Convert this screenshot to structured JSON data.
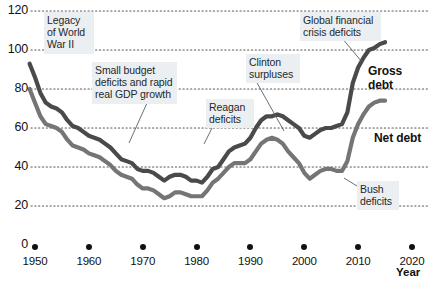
{
  "chart_data": {
    "type": "line",
    "title": "",
    "xlabel": "Year",
    "ylabel": "",
    "xlim": [
      1948,
      2022
    ],
    "ylim": [
      0,
      120
    ],
    "grid": "horizontal-dotted",
    "legend": "inline-direct-labels",
    "y_ticks": [
      0,
      20,
      40,
      60,
      80,
      100,
      120
    ],
    "x_ticks": [
      1950,
      1960,
      1970,
      1980,
      1990,
      2000,
      2010,
      2020
    ],
    "series": [
      {
        "name": "Gross debt",
        "color": "#4a4a4a",
        "x": [
          1949,
          1950,
          1951,
          1952,
          1953,
          1954,
          1955,
          1956,
          1957,
          1958,
          1959,
          1960,
          1961,
          1962,
          1963,
          1964,
          1965,
          1966,
          1967,
          1968,
          1969,
          1970,
          1971,
          1972,
          1973,
          1974,
          1975,
          1976,
          1977,
          1978,
          1979,
          1980,
          1981,
          1982,
          1983,
          1984,
          1985,
          1986,
          1987,
          1988,
          1989,
          1990,
          1991,
          1992,
          1993,
          1994,
          1995,
          1996,
          1997,
          1998,
          1999,
          2000,
          2001,
          2002,
          2003,
          2004,
          2005,
          2006,
          2007,
          2008,
          2009,
          2010,
          2011,
          2012,
          2013,
          2014,
          2015
        ],
        "values": [
          93,
          86,
          78,
          73,
          71,
          70,
          68,
          64,
          61,
          60,
          58,
          56,
          55,
          54,
          52,
          50,
          47,
          44,
          43,
          42,
          39,
          38,
          38,
          37,
          35,
          33,
          35,
          36,
          36,
          35,
          33,
          33,
          32,
          35,
          39,
          40,
          44,
          48,
          50,
          51,
          52,
          55,
          60,
          64,
          66,
          66,
          67,
          66,
          64,
          62,
          60,
          56,
          55,
          57,
          59,
          60,
          60,
          61,
          62,
          68,
          83,
          91,
          96,
          100,
          101,
          103,
          104
        ]
      },
      {
        "name": "Net debt",
        "color": "#757575",
        "x": [
          1949,
          1950,
          1951,
          1952,
          1953,
          1954,
          1955,
          1956,
          1957,
          1958,
          1959,
          1960,
          1961,
          1962,
          1963,
          1964,
          1965,
          1966,
          1967,
          1968,
          1969,
          1970,
          1971,
          1972,
          1973,
          1974,
          1975,
          1976,
          1977,
          1978,
          1979,
          1980,
          1981,
          1982,
          1983,
          1984,
          1985,
          1986,
          1987,
          1988,
          1989,
          1990,
          1991,
          1992,
          1993,
          1994,
          1995,
          1996,
          1997,
          1998,
          1999,
          2000,
          2001,
          2002,
          2003,
          2004,
          2005,
          2006,
          2007,
          2008,
          2009,
          2010,
          2011,
          2012,
          2013,
          2014,
          2015
        ],
        "values": [
          80,
          73,
          66,
          62,
          61,
          60,
          58,
          54,
          51,
          50,
          49,
          47,
          46,
          45,
          43,
          41,
          38,
          36,
          35,
          34,
          31,
          29,
          29,
          28,
          26,
          24,
          25,
          27,
          27,
          26,
          25,
          25,
          25,
          28,
          32,
          34,
          37,
          40,
          42,
          42,
          42,
          44,
          48,
          52,
          54,
          55,
          54,
          52,
          48,
          45,
          42,
          37,
          34,
          36,
          38,
          39,
          39,
          38,
          38,
          43,
          55,
          62,
          67,
          71,
          73,
          74,
          74
        ]
      }
    ],
    "annotations": [
      {
        "id": "legacy-wwii",
        "text": "Legacy\nof World\nWar II",
        "x": 44,
        "y": 12,
        "w": 44,
        "leader": {
          "x1": 66,
          "y1": 50,
          "x2": 48,
          "y2": 42
        }
      },
      {
        "id": "small-budget-deficits",
        "text": "Small budget\ndeficits and rapid\nreal GDP growth",
        "x": 92,
        "y": 62,
        "w": 79,
        "leader": {
          "x1": 147,
          "y1": 103,
          "x2": 129,
          "y2": 143
        }
      },
      {
        "id": "reagan-deficits",
        "text": "Reagan\ndeficits",
        "x": 206,
        "y": 99,
        "w": 42,
        "leader": {
          "x1": 213,
          "y1": 126,
          "x2": 204,
          "y2": 144
        }
      },
      {
        "id": "clinton-surpluses",
        "text": "Clinton\nsurpluses",
        "x": 246,
        "y": 54,
        "w": 48,
        "leader": {
          "x1": 256,
          "y1": 81,
          "x2": 284,
          "y2": 131
        }
      },
      {
        "id": "global-financial-crisis",
        "text": "Global financial\ncrisis deficits",
        "x": 300,
        "y": 12,
        "w": 75,
        "leader": {
          "x1": 342,
          "y1": 38,
          "x2": 362,
          "y2": 62
        }
      },
      {
        "id": "bush-deficits",
        "text": "Bush\ndeficits",
        "x": 357,
        "y": 181,
        "w": 36,
        "leader": {
          "x1": 357,
          "y1": 186,
          "x2": 344,
          "y2": 178
        }
      }
    ],
    "series_labels": [
      {
        "id": "gross-debt-label",
        "text": "Gross debt",
        "x": 368,
        "y": 64
      },
      {
        "id": "net-debt-label",
        "text": "Net debt",
        "x": 374,
        "y": 131
      }
    ]
  },
  "axis": {
    "x_title": "Year",
    "y_tick_labels": [
      "120",
      "100",
      "80",
      "60",
      "40",
      "20",
      "0"
    ],
    "x_tick_labels": [
      "1950",
      "1960",
      "1970",
      "1980",
      "1990",
      "2000",
      "2010",
      "2020"
    ]
  },
  "colors": {
    "gross_debt": "#4a4a4a",
    "net_debt": "#757575",
    "gridline": "#555555",
    "note_bg": "#eceff1",
    "text": "#111111"
  }
}
